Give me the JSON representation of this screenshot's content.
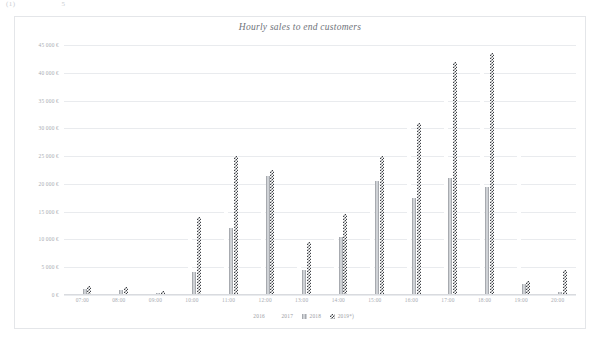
{
  "page": {
    "top_fragment_left": "(1)",
    "top_fragment_right": "5"
  },
  "chart_card": {
    "title": "Hourly sales to end customers"
  },
  "legend": {
    "position": "bottom",
    "items": [
      {
        "label": "2016",
        "swatch": "series-2016-swatch"
      },
      {
        "label": "2017",
        "swatch": "series-2017-swatch"
      },
      {
        "label": "2018",
        "swatch": "series-2018-swatch"
      },
      {
        "label": "2019*)",
        "swatch": "series-2019-swatch"
      }
    ]
  },
  "chart_data": {
    "type": "bar",
    "title": "Hourly sales to end customers",
    "subtitle": "",
    "xlabel": "",
    "ylabel": "",
    "ylim": [
      0,
      45000
    ],
    "ytick_step": 5000,
    "ytick_labels": [
      "45 000 €",
      "40 000 €",
      "35 000 €",
      "30 000 €",
      "25 000 €",
      "20 000 €",
      "15 000 €",
      "10 000 €",
      "5 000 €",
      "0 €"
    ],
    "ytick_values": [
      45000,
      40000,
      35000,
      30000,
      25000,
      20000,
      15000,
      10000,
      5000,
      0
    ],
    "grid": true,
    "legend_position": "bottom",
    "categories": [
      "07:00",
      "08:00",
      "09:00",
      "10:00",
      "11:00",
      "12:00",
      "13:00",
      "14:00",
      "15:00",
      "16:00",
      "17:00",
      "18:00",
      "19:00",
      "20:00"
    ],
    "series": [
      {
        "name": "2016",
        "pattern": "light-dotted",
        "values": [
          200,
          400,
          300,
          600,
          1500,
          1200,
          900,
          1100,
          1800,
          2400,
          3200,
          2600,
          1400,
          300
        ]
      },
      {
        "name": "2017",
        "pattern": "fine-dotted",
        "values": [
          600,
          1400,
          500,
          11500,
          15500,
          18500,
          6000,
          14500,
          18500,
          33500,
          38500,
          41000,
          26500,
          1200
        ]
      },
      {
        "name": "2018",
        "pattern": "grey-vertical-stripe",
        "values": [
          1100,
          900,
          400,
          4200,
          12000,
          21500,
          4500,
          10500,
          20500,
          17500,
          21000,
          19500,
          2000,
          600
        ]
      },
      {
        "name": "2019*)",
        "pattern": "dark-checkerboard",
        "values": [
          1600,
          1500,
          700,
          14000,
          25000,
          22500,
          9500,
          14500,
          25000,
          31000,
          42000,
          43500,
          2500,
          4500
        ]
      }
    ]
  }
}
